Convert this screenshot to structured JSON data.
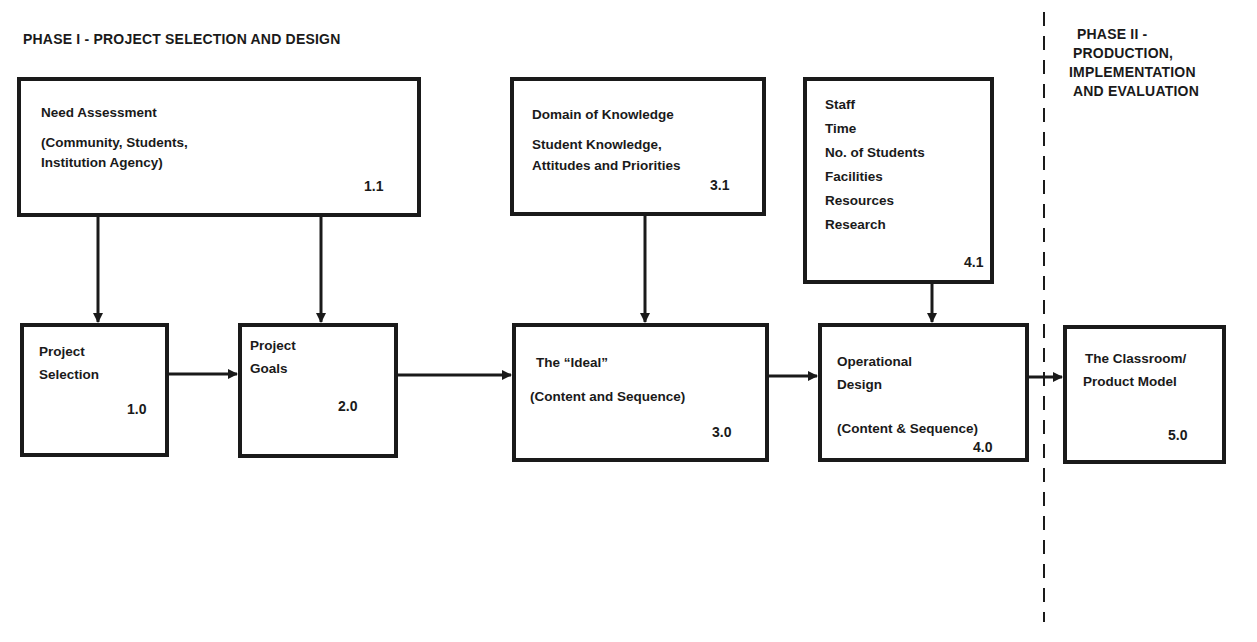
{
  "phases": {
    "phase1": {
      "title": "PHASE I - PROJECT SELECTION AND DESIGN"
    },
    "phase2": {
      "title_lines": [
        "PHASE II -",
        "PRODUCTION,",
        "IMPLEMENTATION",
        "AND EVALUATION"
      ]
    }
  },
  "boxes": {
    "b11": {
      "lines": [
        "Need Assessment",
        "(Community, Students,",
        " Institution Agency)"
      ],
      "number": "1.1"
    },
    "b31": {
      "lines": [
        "Domain of Knowledge",
        "Student Knowledge,",
        "Attitudes and Priorities"
      ],
      "number": "3.1"
    },
    "b41": {
      "lines": [
        "Staff",
        "Time",
        "No. of Students",
        "Facilities",
        "Resources",
        "Research"
      ],
      "number": "4.1"
    },
    "b10": {
      "lines": [
        "Project",
        "Selection"
      ],
      "number": "1.0"
    },
    "b20": {
      "lines": [
        "Project",
        "Goals"
      ],
      "number": "2.0"
    },
    "b30": {
      "lines": [
        "The “Ideal”",
        "(Content and Sequence)"
      ],
      "number": "3.0"
    },
    "b40": {
      "lines": [
        "Operational",
        "Design",
        "(Content & Sequence)"
      ],
      "number": "4.0"
    },
    "b50": {
      "lines": [
        "The Classroom/",
        "Product Model"
      ],
      "number": "5.0"
    }
  },
  "colors": {
    "ink": "#1a1a1a",
    "background": "#ffffff"
  }
}
